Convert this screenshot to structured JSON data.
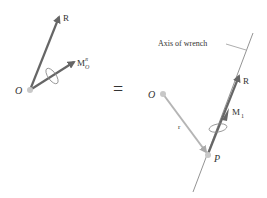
{
  "left": {
    "origin_label": "O",
    "resultant_label": "R",
    "moment_label_main": "M",
    "moment_sub": "O",
    "moment_sup": "R"
  },
  "equals": "=",
  "right": {
    "axis_label": "Axis of wrench",
    "origin_label": "O",
    "point_label": "P",
    "position_label": "r",
    "resultant_label": "R",
    "moment_label_main": "M",
    "moment_sub": "1"
  },
  "colors": {
    "arrow": "#666666",
    "position_vector": "#b5b5b5",
    "point": "#c8c8c8",
    "axis": "#777777"
  }
}
